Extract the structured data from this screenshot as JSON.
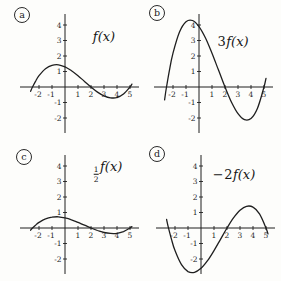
{
  "style": {
    "ink": "#1f1f1f",
    "background": "#fdfdfb"
  },
  "chart_data": [
    {
      "type": "line",
      "panel_letter": "a",
      "label_coeff": "",
      "label_frac": null,
      "label_fn": "f(x)",
      "x": [
        -2.65,
        -2.5,
        -2.25,
        -2,
        -1.5,
        -1,
        -0.5,
        0,
        0.5,
        1,
        1.5,
        2,
        2.5,
        3,
        3.5,
        4,
        4.5,
        5,
        5.15
      ],
      "y": [
        -0.28,
        0,
        0.4,
        0.73,
        1.18,
        1.4,
        1.43,
        1.3,
        1.05,
        0.73,
        0.36,
        0,
        -0.33,
        -0.57,
        -0.7,
        -0.68,
        -0.46,
        0,
        0.19
      ],
      "xticks": [
        -2,
        -1,
        1,
        2,
        3,
        4,
        5
      ],
      "yticks": [
        4,
        3,
        2,
        1,
        -1,
        -2
      ],
      "xlim": [
        -3.4,
        5.6
      ],
      "ylim": [
        -2.9,
        4.6
      ],
      "grid": false,
      "layout": {
        "ox": 65,
        "letter_pos": [
          14,
          7
        ],
        "label_pos": [
          104,
          36
        ]
      }
    },
    {
      "type": "line",
      "panel_letter": "b",
      "label_coeff": "3",
      "label_frac": null,
      "label_fn": "f(x)",
      "x": [
        -2.65,
        -2.5,
        -2.25,
        -2,
        -1.5,
        -1,
        -0.5,
        0,
        0.5,
        1,
        1.5,
        2,
        2.5,
        3,
        3.5,
        4,
        4.5,
        5,
        5.15
      ],
      "y": [
        -0.83,
        0,
        1.2,
        2.18,
        3.55,
        4.21,
        4.29,
        3.9,
        3.16,
        2.18,
        1.09,
        0,
        -0.98,
        -1.72,
        -2.11,
        -2.03,
        -1.37,
        0,
        0.56
      ],
      "xticks": [
        -2,
        -1,
        1,
        2,
        3,
        4,
        5
      ],
      "yticks": [
        4,
        3,
        2,
        1,
        -1,
        -2
      ],
      "xlim": [
        -3.4,
        5.6
      ],
      "ylim": [
        -2.9,
        4.6
      ],
      "grid": false,
      "layout": {
        "ox": 58,
        "letter_pos": [
          8,
          5
        ],
        "label_pos": [
          92,
          41
        ]
      }
    },
    {
      "type": "line",
      "panel_letter": "c",
      "label_coeff": "",
      "label_frac": {
        "num": "1",
        "den": "2"
      },
      "label_fn": "f(x)",
      "x": [
        -2.65,
        -2.5,
        -2.25,
        -2,
        -1.5,
        -1,
        -0.5,
        0,
        0.5,
        1,
        1.5,
        2,
        2.5,
        3,
        3.5,
        4,
        4.5,
        5,
        5.15
      ],
      "y": [
        -0.14,
        0,
        0.2,
        0.36,
        0.59,
        0.7,
        0.72,
        0.65,
        0.53,
        0.36,
        0.18,
        0,
        -0.16,
        -0.29,
        -0.35,
        -0.34,
        -0.23,
        0,
        0.09
      ],
      "xticks": [
        -2,
        -1,
        1,
        2,
        3,
        4,
        5
      ],
      "yticks": [
        4,
        3,
        2,
        1,
        -1,
        -2
      ],
      "xlim": [
        -3.4,
        5.6
      ],
      "ylim": [
        -2.9,
        4.6
      ],
      "grid": false,
      "layout": {
        "ox": 65,
        "letter_pos": [
          16,
          8
        ],
        "label_pos": [
          108,
          30
        ]
      }
    },
    {
      "type": "line",
      "panel_letter": "d",
      "label_coeff": "−2",
      "label_frac": null,
      "label_fn": "f(x)",
      "x": [
        -2.65,
        -2.5,
        -2.25,
        -2,
        -1.5,
        -1,
        -0.5,
        0,
        0.5,
        1,
        1.5,
        2,
        2.5,
        3,
        3.5,
        4,
        4.5,
        5,
        5.15
      ],
      "y": [
        0.55,
        0,
        -0.8,
        -1.46,
        -2.37,
        -2.81,
        -2.86,
        -2.6,
        -2.11,
        -1.46,
        -0.73,
        0,
        0.65,
        1.14,
        1.4,
        1.35,
        0.91,
        0,
        -0.38
      ],
      "xticks": [
        -2,
        -1,
        1,
        2,
        3,
        4,
        5
      ],
      "yticks": [
        4,
        3,
        2,
        1,
        -1,
        -2
      ],
      "xlim": [
        -3.4,
        5.6
      ],
      "ylim": [
        -2.9,
        4.6
      ],
      "grid": false,
      "layout": {
        "ox": 60,
        "letter_pos": [
          8,
          5
        ],
        "label_pos": [
          93,
          33
        ]
      }
    }
  ]
}
